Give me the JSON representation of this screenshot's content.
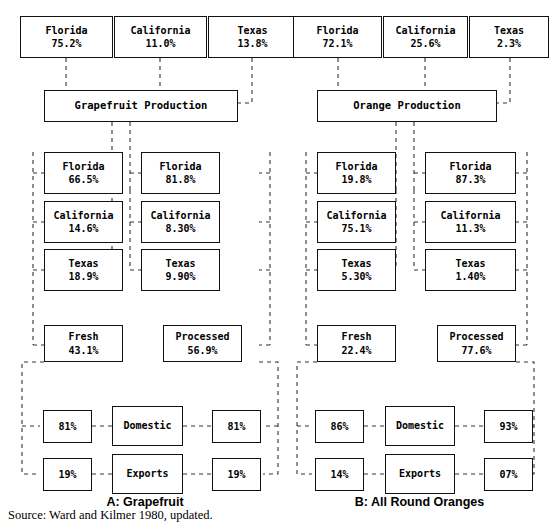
{
  "figure": {
    "source_note": "Source: Ward and Kilmer 1980, updated.",
    "line_color": "#333333",
    "box_border_color": "#111111",
    "background": "#ffffff"
  },
  "panels": [
    {
      "id": "A",
      "caption": "A: Grapefruit",
      "production_label": "Grapefruit Production",
      "production_states": [
        {
          "name": "Florida",
          "value": "75.2%"
        },
        {
          "name": "California",
          "value": "11.0%"
        },
        {
          "name": "Texas",
          "value": "13.8%"
        }
      ],
      "fresh": {
        "label": "Fresh",
        "value": "43.1%"
      },
      "processed": {
        "label": "Processed",
        "value": "56.9%"
      },
      "fresh_states": [
        {
          "name": "Florida",
          "value": "66.5%"
        },
        {
          "name": "California",
          "value": "14.6%"
        },
        {
          "name": "Texas",
          "value": "18.9%"
        }
      ],
      "processed_states": [
        {
          "name": "Florida",
          "value": "81.8%"
        },
        {
          "name": "California",
          "value": "8.30%"
        },
        {
          "name": "Texas",
          "value": "9.90%"
        }
      ],
      "channels": [
        {
          "label": "Domestic",
          "fresh_share": "81%",
          "processed_share": "81%"
        },
        {
          "label": "Exports",
          "fresh_share": "19%",
          "processed_share": "19%"
        }
      ]
    },
    {
      "id": "B",
      "caption": "B: All Round Oranges",
      "production_label": "Orange Production",
      "production_states": [
        {
          "name": "Florida",
          "value": "72.1%"
        },
        {
          "name": "California",
          "value": "25.6%"
        },
        {
          "name": "Texas",
          "value": "2.3%"
        }
      ],
      "fresh": {
        "label": "Fresh",
        "value": "22.4%"
      },
      "processed": {
        "label": "Processed",
        "value": "77.6%"
      },
      "fresh_states": [
        {
          "name": "Florida",
          "value": "19.8%"
        },
        {
          "name": "California",
          "value": "75.1%"
        },
        {
          "name": "Texas",
          "value": "5.30%"
        }
      ],
      "processed_states": [
        {
          "name": "Florida",
          "value": "87.3%"
        },
        {
          "name": "California",
          "value": "11.3%"
        },
        {
          "name": "Texas",
          "value": "1.40%"
        }
      ],
      "channels": [
        {
          "label": "Domestic",
          "fresh_share": "86%",
          "processed_share": "93%"
        },
        {
          "label": "Exports",
          "fresh_share": "14%",
          "processed_share": "07%"
        }
      ]
    }
  ]
}
